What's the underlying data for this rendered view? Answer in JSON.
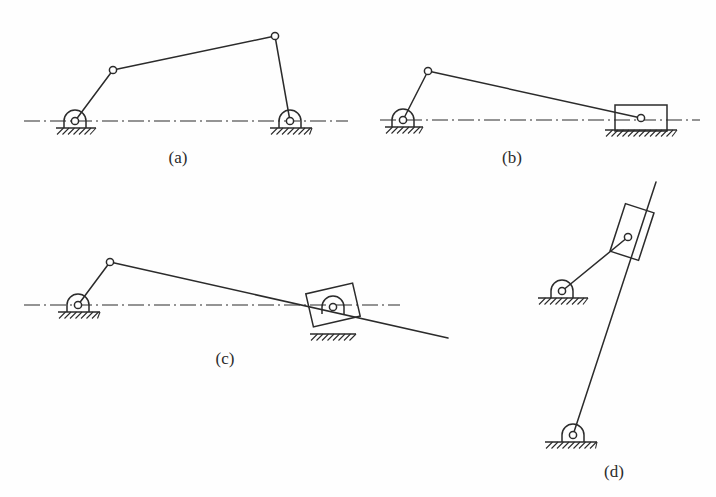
{
  "figure": {
    "background_color": "#fefefe",
    "line_color": "#2b2b2b",
    "panels": [
      {
        "id": "a",
        "label": "(a)",
        "label_x": 178,
        "label_y": 163,
        "mechanism": "four-bar linkage with two fixed revolute pivots",
        "centerline": {
          "x1": 24,
          "y1": 121,
          "x2": 348,
          "y2": 121
        },
        "fixed_pivots": [
          {
            "name": "left-ground-pivot",
            "x": 75,
            "y": 121
          },
          {
            "name": "right-ground-pivot",
            "x": 290,
            "y": 121
          }
        ],
        "moving_joints": [
          {
            "name": "upper-left-joint",
            "x": 113,
            "y": 70
          },
          {
            "name": "upper-right-joint",
            "x": 275,
            "y": 36
          }
        ],
        "links": [
          {
            "name": "crank-link",
            "x1": 75,
            "y1": 121,
            "x2": 113,
            "y2": 70
          },
          {
            "name": "coupler-link",
            "x1": 113,
            "y1": 70,
            "x2": 275,
            "y2": 36
          },
          {
            "name": "rocker-link",
            "x1": 275,
            "y1": 36,
            "x2": 290,
            "y2": 121
          }
        ],
        "ground_bases": [
          {
            "name": "left-ground-base",
            "x": 56,
            "y": 128,
            "width": 40
          },
          {
            "name": "right-ground-base",
            "x": 270,
            "y": 128,
            "width": 42
          }
        ],
        "sliders": []
      },
      {
        "id": "b",
        "label": "(b)",
        "label_x": 512,
        "label_y": 163,
        "mechanism": "slider-crank with horizontal translating block",
        "centerline": {
          "x1": 380,
          "y1": 120,
          "x2": 700,
          "y2": 120
        },
        "fixed_pivots": [
          {
            "name": "crank-ground-pivot",
            "x": 403,
            "y": 120
          }
        ],
        "moving_joints": [
          {
            "name": "crank-pin-joint",
            "x": 428,
            "y": 71
          },
          {
            "name": "slider-pin-joint",
            "x": 641,
            "y": 118
          }
        ],
        "links": [
          {
            "name": "crank-link",
            "x1": 403,
            "y1": 120,
            "x2": 428,
            "y2": 71
          },
          {
            "name": "connecting-rod",
            "x1": 428,
            "y1": 71,
            "x2": 641,
            "y2": 118
          }
        ],
        "ground_bases": [
          {
            "name": "crank-ground-base",
            "x": 385,
            "y": 127,
            "width": 38
          },
          {
            "name": "slider-track-base",
            "x": 605,
            "y": 130,
            "width": 72
          }
        ],
        "sliders": [
          {
            "name": "translating-slider-block",
            "cx": 641,
            "cy": 118,
            "width": 52,
            "height": 26,
            "rotation": 0
          }
        ]
      },
      {
        "id": "c",
        "label": "(c)",
        "label_x": 225,
        "label_y": 364,
        "mechanism": "oscillating swinging-block mechanism with extended link",
        "centerline": {
          "x1": 24,
          "y1": 305,
          "x2": 400,
          "y2": 305
        },
        "fixed_pivots": [
          {
            "name": "crank-ground-pivot",
            "x": 78,
            "y": 305
          },
          {
            "name": "swinging-block-ground-pivot",
            "x": 333,
            "y": 307
          }
        ],
        "moving_joints": [
          {
            "name": "crank-pin-joint",
            "x": 110,
            "y": 262
          }
        ],
        "links": [
          {
            "name": "crank-link",
            "x1": 78,
            "y1": 305,
            "x2": 110,
            "y2": 262
          },
          {
            "name": "sliding-rod-link",
            "x1": 110,
            "y1": 262,
            "x2": 448,
            "y2": 338
          }
        ],
        "ground_bases": [
          {
            "name": "crank-ground-base",
            "x": 58,
            "y": 312,
            "width": 42
          },
          {
            "name": "block-ground-base",
            "x": 310,
            "y": 334,
            "width": 46
          }
        ],
        "sliders": [
          {
            "name": "swinging-slider-block",
            "cx": 333,
            "cy": 305,
            "width": 48,
            "height": 34,
            "rotation": -13
          }
        ]
      },
      {
        "id": "d",
        "label": "(d)",
        "label_x": 614,
        "label_y": 477,
        "mechanism": "inverted slider-crank with tilted sliding block",
        "centerline": null,
        "fixed_pivots": [
          {
            "name": "upper-ground-pivot",
            "x": 562,
            "y": 291
          },
          {
            "name": "lower-ground-pivot",
            "x": 573,
            "y": 435
          }
        ],
        "moving_joints": [
          {
            "name": "block-pin-joint",
            "x": 628,
            "y": 237
          }
        ],
        "links": [
          {
            "name": "short-crank-link",
            "x1": 562,
            "y1": 291,
            "x2": 628,
            "y2": 237
          },
          {
            "name": "long-sliding-link",
            "x1": 573,
            "y1": 435,
            "x2": 656,
            "y2": 182
          }
        ],
        "ground_bases": [
          {
            "name": "upper-ground-base",
            "x": 538,
            "y": 298,
            "width": 50
          },
          {
            "name": "lower-ground-base",
            "x": 545,
            "y": 442,
            "width": 52
          }
        ],
        "sliders": [
          {
            "name": "tilted-slider-block",
            "cx": 632,
            "cy": 232,
            "width": 30,
            "height": 50,
            "rotation": 18
          }
        ]
      }
    ]
  }
}
